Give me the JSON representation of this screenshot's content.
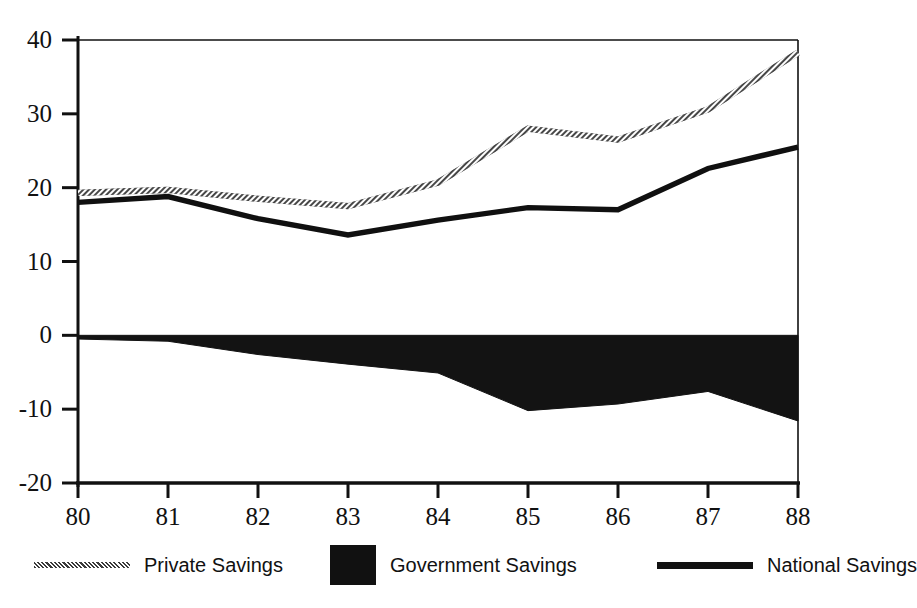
{
  "chart_title": "Savings (Percent of GDP)",
  "axes": {
    "y_ticks": [
      "40",
      "30",
      "20",
      "10",
      "0",
      "-10",
      "-20"
    ],
    "x_ticks": [
      "80",
      "81",
      "82",
      "83",
      "84",
      "85",
      "86",
      "87",
      "88"
    ]
  },
  "legend": {
    "items": [
      {
        "label": "Private Savings",
        "marker": "hatched-line-swatch",
        "color": "#6f6f6f"
      },
      {
        "label": "Government Savings",
        "marker": "filled-square-swatch",
        "color": "#111111"
      },
      {
        "label": "National Savings",
        "marker": "solid-line-swatch",
        "color": "#111111"
      }
    ]
  },
  "chart_data": {
    "type": "line",
    "title": "Savings (Percent of GDP)",
    "xlabel": "",
    "ylabel": "",
    "x": [
      80,
      81,
      82,
      83,
      84,
      85,
      86,
      87,
      88
    ],
    "categories": [
      "80",
      "81",
      "82",
      "83",
      "84",
      "85",
      "86",
      "87",
      "88"
    ],
    "xlim": [
      80,
      88
    ],
    "ylim": [
      -20,
      40
    ],
    "y_ticks": [
      40,
      30,
      20,
      10,
      0,
      -10,
      -20
    ],
    "x_ticks": [
      80,
      81,
      82,
      83,
      84,
      85,
      86,
      87,
      88
    ],
    "grid": false,
    "legend_position": "bottom",
    "series": [
      {
        "name": "Private Savings",
        "style": "hatched-line",
        "color": "#6f6f6f",
        "values": [
          19.3,
          19.7,
          18.5,
          17.5,
          20.7,
          28.0,
          26.5,
          30.6,
          38.3
        ]
      },
      {
        "name": "Government Savings",
        "style": "filled-area",
        "color": "#111111",
        "values": [
          -0.5,
          -0.8,
          -2.6,
          -3.9,
          -5.1,
          -10.2,
          -9.3,
          -7.6,
          -11.6
        ]
      },
      {
        "name": "National Savings",
        "style": "solid-line",
        "color": "#111111",
        "values": [
          18.0,
          18.8,
          15.8,
          13.6,
          15.6,
          17.3,
          17.0,
          22.6,
          25.5
        ]
      }
    ]
  },
  "geometry": {
    "plot_left": 78,
    "plot_right": 798,
    "plot_top": 40,
    "plot_bottom": 483,
    "y_max": 40,
    "y_min": -20
  }
}
